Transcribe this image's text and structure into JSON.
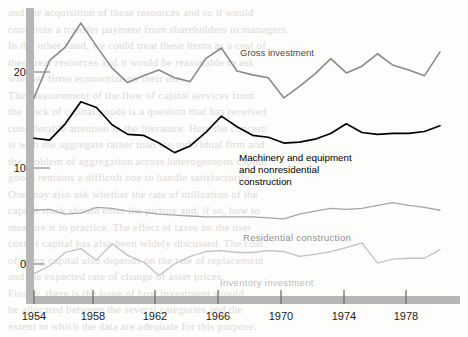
{
  "chart_data": {
    "type": "line",
    "title": "",
    "xlabel": "",
    "ylabel": "",
    "xlim": [
      1953,
      1980
    ],
    "ylim": [
      -4,
      27
    ],
    "xticks": [
      1954,
      1958,
      1962,
      1966,
      1970,
      1974,
      1978
    ],
    "yticks": [
      0,
      10,
      20
    ],
    "grid": false,
    "legend": "inline-annotations",
    "x": [
      1954,
      1955,
      1956,
      1957,
      1958,
      1959,
      1960,
      1961,
      1962,
      1963,
      1964,
      1965,
      1966,
      1967,
      1968,
      1969,
      1970,
      1971,
      1972,
      1973,
      1974,
      1975,
      1976,
      1977,
      1978,
      1979,
      1980
    ],
    "series": [
      {
        "name": "Gross investment",
        "color": "#8a8a8a",
        "width": 1.6,
        "values": [
          17.3,
          21.2,
          22.6,
          25.1,
          22.7,
          20.4,
          18.9,
          19.6,
          20.2,
          19.4,
          19.0,
          21.4,
          22.5,
          20.1,
          19.7,
          19.4,
          17.3,
          18.5,
          19.8,
          21.4,
          19.9,
          20.6,
          21.9,
          20.7,
          20.2,
          19.6,
          22.1
        ]
      },
      {
        "name": "Machinery and equipment\nand nonresidential\nconstruction",
        "color": "#000000",
        "width": 1.7,
        "values": [
          13.1,
          12.9,
          14.6,
          16.9,
          16.3,
          14.5,
          13.5,
          13.4,
          12.6,
          11.6,
          12.3,
          13.7,
          15.4,
          14.3,
          13.4,
          13.2,
          12.6,
          12.7,
          13.0,
          13.6,
          14.6,
          13.7,
          13.5,
          13.6,
          13.6,
          13.8,
          14.4
        ]
      },
      {
        "name": "Residential  construction",
        "color": "#a6a6a6",
        "width": 1.3,
        "values": [
          5.6,
          5.7,
          5.2,
          5.3,
          5.9,
          5.8,
          5.5,
          5.4,
          5.2,
          5.1,
          5.0,
          4.9,
          4.9,
          4.9,
          4.9,
          4.8,
          4.7,
          5.2,
          5.5,
          5.8,
          5.7,
          5.8,
          6.1,
          6.4,
          6.1,
          5.9,
          5.6
        ]
      },
      {
        "name": "Inventory  investment",
        "color": "#c2c2c2",
        "width": 1.3,
        "values": [
          -1.0,
          -0.2,
          1.2,
          1.6,
          0.4,
          2.1,
          0.9,
          0.2,
          -1.2,
          0.0,
          0.8,
          1.3,
          1.4,
          1.2,
          1.2,
          1.4,
          1.3,
          0.8,
          1.0,
          1.3,
          1.7,
          2.2,
          0.1,
          0.5,
          0.6,
          0.6,
          1.5
        ]
      }
    ],
    "annotations": [
      {
        "text": "Gross investment",
        "x_px": 240,
        "y_px": 47
      },
      {
        "text": "Machinery and equipment\nand nonresidential\nconstruction",
        "x_px": 239,
        "y_px": 152
      },
      {
        "text": "Residential  construction",
        "x_px": 243,
        "y_px": 232
      },
      {
        "text": "Inventory  investment",
        "x_px": 220,
        "y_px": 277
      }
    ]
  },
  "axis": {
    "y_labels": [
      "20",
      "10",
      "0"
    ],
    "x_labels": [
      "1954",
      "1958",
      "1962",
      "1966",
      "1970",
      "1974",
      "1978"
    ]
  },
  "background_text": {
    "lines": [
      "and the acquisition of these resources and so it would",
      "constitute a transfer payment from shareholders to managers.",
      "In the other hand, we could treat these items as a cost of",
      "these real resources and it would be reasonable to ask",
      "whether firms economize on their use.",
      "The measurement of the flow of capital services from",
      "the stock of capital goods is a question that has received",
      "considerable attention in the literature. Here the concern",
      "is with the aggregate rather than the individual firm and",
      "the problem of aggregation across heterogeneous capital",
      "goods remains a difficult one to handle satisfactorily.",
      "One may also ask whether the rate of utilization of the",
      "capital stock should enter the picture and, if so, how to",
      "measure it in practice. The effect of taxes on the user",
      "cost of capital has also been widely discussed. The cost",
      "of using capital also depends on the rate of replacement",
      "and the expected rate of change of asset prices.",
      "Finally, there is the issue of how investment should",
      "be allocated between the several categories and the",
      "extent to which the data are adequate for this purpose."
    ]
  }
}
